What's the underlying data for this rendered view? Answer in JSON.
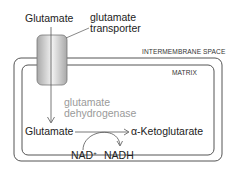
{
  "diagram": {
    "outer_label": "Glutamate",
    "transporter_label_line1": "glutamate",
    "transporter_label_line2": "transporter",
    "intermembrane_label": "INTERMEMBRANE SPACE",
    "matrix_label": "MATRIX",
    "enzyme_line1": "glutamate",
    "enzyme_line2": "dehydrogenase",
    "substrate": "Glutamate",
    "product": "α-Ketoglutarate",
    "cofactor_in": "NAD",
    "cofactor_in_sup": "+",
    "cofactor_out": "NADH",
    "colors": {
      "membrane": "#555555",
      "enzyme_text": "#9a9a9a",
      "transporter_fill": "#d8d8d8"
    }
  }
}
